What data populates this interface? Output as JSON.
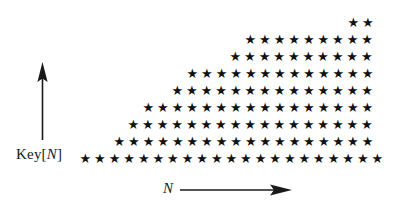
{
  "figure": {
    "background_color": "#ffffff",
    "marker_color": "#111111",
    "axis_color": "#1a1a1a",
    "width": 399,
    "height": 210
  },
  "axes": {
    "y": {
      "label_prefix": "Key[",
      "label_variable": "N",
      "label_suffix": "]",
      "label_text": "Key[N]",
      "arrow_direction": "up",
      "arrow_icon": "up-arrow-icon"
    },
    "x": {
      "label_text": "N",
      "arrow_direction": "right",
      "arrow_icon": "right-arrow-icon"
    }
  },
  "chart_data": {
    "type": "scatter",
    "title": "",
    "subtitle": "",
    "xlabel": "N",
    "ylabel": "Key[N]",
    "marker": "star",
    "marker_symbol": "★",
    "grid": false,
    "legend": null,
    "axis_ticks": false,
    "axis_arrows": true,
    "xlim": [
      0,
      399
    ],
    "ylim": [
      0,
      210
    ],
    "grid_spacing": {
      "column_px": 14.6,
      "row_px": 16.9
    },
    "rows": [
      {
        "index": 0,
        "y_px": 158,
        "start_x_px": 85,
        "count": 21
      },
      {
        "index": 1,
        "y_px": 141,
        "start_x_px": 119,
        "count": 18
      },
      {
        "index": 2,
        "y_px": 124,
        "start_x_px": 133,
        "count": 17
      },
      {
        "index": 3,
        "y_px": 107,
        "start_x_px": 148,
        "count": 16
      },
      {
        "index": 4,
        "y_px": 90,
        "start_x_px": 177,
        "count": 14
      },
      {
        "index": 5,
        "y_px": 73,
        "start_x_px": 192,
        "count": 13
      },
      {
        "index": 6,
        "y_px": 56,
        "start_x_px": 235,
        "count": 10
      },
      {
        "index": 7,
        "y_px": 39,
        "start_x_px": 250,
        "count": 9
      },
      {
        "index": 8,
        "y_px": 22,
        "start_x_px": 353,
        "count": 2
      }
    ],
    "points": [
      [
        85,
        158
      ],
      [
        99.6,
        158
      ],
      [
        114.2,
        158
      ],
      [
        128.8,
        158
      ],
      [
        143.4,
        158
      ],
      [
        158,
        158
      ],
      [
        172.6,
        158
      ],
      [
        187.2,
        158
      ],
      [
        201.8,
        158
      ],
      [
        216.4,
        158
      ],
      [
        231,
        158
      ],
      [
        245.6,
        158
      ],
      [
        260.2,
        158
      ],
      [
        274.8,
        158
      ],
      [
        289.4,
        158
      ],
      [
        304,
        158
      ],
      [
        318.6,
        158
      ],
      [
        333.2,
        158
      ],
      [
        347.8,
        158
      ],
      [
        362.4,
        158
      ],
      [
        377,
        158
      ],
      [
        119,
        141
      ],
      [
        133.6,
        141
      ],
      [
        148.2,
        141
      ],
      [
        162.8,
        141
      ],
      [
        177.4,
        141
      ],
      [
        192,
        141
      ],
      [
        206.6,
        141
      ],
      [
        221.2,
        141
      ],
      [
        235.8,
        141
      ],
      [
        250.4,
        141
      ],
      [
        265,
        141
      ],
      [
        279.6,
        141
      ],
      [
        294.2,
        141
      ],
      [
        308.8,
        141
      ],
      [
        323.4,
        141
      ],
      [
        338,
        141
      ],
      [
        352.6,
        141
      ],
      [
        367.2,
        141
      ],
      [
        133,
        124
      ],
      [
        147.6,
        124
      ],
      [
        162.2,
        124
      ],
      [
        176.8,
        124
      ],
      [
        191.4,
        124
      ],
      [
        206,
        124
      ],
      [
        220.6,
        124
      ],
      [
        235.2,
        124
      ],
      [
        249.8,
        124
      ],
      [
        264.4,
        124
      ],
      [
        279,
        124
      ],
      [
        293.6,
        124
      ],
      [
        308.2,
        124
      ],
      [
        322.8,
        124
      ],
      [
        337.4,
        124
      ],
      [
        352,
        124
      ],
      [
        366.6,
        124
      ],
      [
        148,
        107
      ],
      [
        162.6,
        107
      ],
      [
        177.2,
        107
      ],
      [
        191.8,
        107
      ],
      [
        206.4,
        107
      ],
      [
        221,
        107
      ],
      [
        235.6,
        107
      ],
      [
        250.2,
        107
      ],
      [
        264.8,
        107
      ],
      [
        279.4,
        107
      ],
      [
        294,
        107
      ],
      [
        308.6,
        107
      ],
      [
        323.2,
        107
      ],
      [
        337.8,
        107
      ],
      [
        352.4,
        107
      ],
      [
        367,
        107
      ],
      [
        177,
        90
      ],
      [
        191.6,
        90
      ],
      [
        206.2,
        90
      ],
      [
        220.8,
        90
      ],
      [
        235.4,
        90
      ],
      [
        250,
        90
      ],
      [
        264.6,
        90
      ],
      [
        279.2,
        90
      ],
      [
        293.8,
        90
      ],
      [
        308.4,
        90
      ],
      [
        323,
        90
      ],
      [
        337.6,
        90
      ],
      [
        352.2,
        90
      ],
      [
        366.8,
        90
      ],
      [
        192,
        73
      ],
      [
        206.6,
        73
      ],
      [
        221.2,
        73
      ],
      [
        235.8,
        73
      ],
      [
        250.4,
        73
      ],
      [
        265,
        73
      ],
      [
        279.6,
        73
      ],
      [
        294.2,
        73
      ],
      [
        308.8,
        73
      ],
      [
        323.4,
        73
      ],
      [
        338,
        73
      ],
      [
        352.6,
        73
      ],
      [
        367.2,
        73
      ],
      [
        235,
        56
      ],
      [
        249.6,
        56
      ],
      [
        264.2,
        56
      ],
      [
        278.8,
        56
      ],
      [
        293.4,
        56
      ],
      [
        308,
        56
      ],
      [
        322.6,
        56
      ],
      [
        337.2,
        56
      ],
      [
        351.8,
        56
      ],
      [
        366.4,
        56
      ],
      [
        250,
        39
      ],
      [
        264.6,
        39
      ],
      [
        279.2,
        39
      ],
      [
        293.8,
        39
      ],
      [
        308.4,
        39
      ],
      [
        323,
        39
      ],
      [
        337.6,
        39
      ],
      [
        352.2,
        39
      ],
      [
        366.8,
        39
      ],
      [
        353,
        22
      ],
      [
        367.6,
        22
      ]
    ]
  }
}
